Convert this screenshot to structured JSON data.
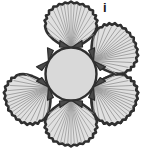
{
  "figure": {
    "panel_label": "i",
    "caption_text": "",
    "background_color": "#ffffff"
  },
  "diagram": {
    "type": "radial-arrangement",
    "center_disc": {
      "name": "central-disc",
      "cx": 71,
      "cy": 74,
      "rx": 25.5,
      "ry": 26.5,
      "fill": "#d9d9d9",
      "stroke": "#2f2f2f",
      "stroke_width": 2.4
    },
    "shell_count": 6,
    "shell_style": {
      "fill": "#e0e0e0",
      "stroke": "#303030",
      "stroke_width": 2.6,
      "rib_color": "#9a9a9a",
      "rib_width": 0.8,
      "rib_count": 13,
      "scallop_lobes": 9
    },
    "hinge_style": {
      "fill": "#4a4a4a",
      "stroke": "#2b2b2b"
    },
    "shells": [
      {
        "id": "shell-top",
        "angle": -90,
        "label": "top"
      },
      {
        "id": "shell-upper-right",
        "angle": -30,
        "label": "upper-right"
      },
      {
        "id": "shell-lower-right",
        "angle": 30,
        "label": "lower-right"
      },
      {
        "id": "shell-bottom",
        "angle": 90,
        "label": "bottom"
      },
      {
        "id": "shell-lower-left",
        "angle": 150,
        "label": "lower-left"
      },
      {
        "id": "shell-upper-left",
        "angle": 210,
        "label": "upper-left"
      }
    ]
  }
}
